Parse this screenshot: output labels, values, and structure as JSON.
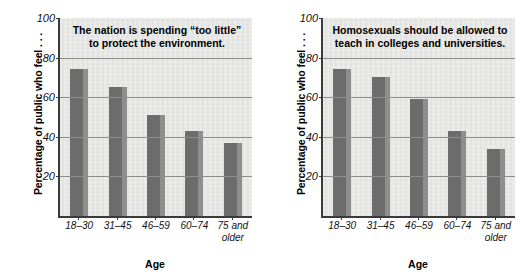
{
  "chart_data": [
    {
      "type": "bar",
      "title": "The nation is spending “too little” to protect the environment.",
      "title_line1": "The nation is spending “too little”",
      "title_line2": "to protect the environment.",
      "xlabel": "Age",
      "ylabel": "Percentage of public who feel . . .",
      "categories": [
        "18–30",
        "31–45",
        "46–59",
        "75 and older"
      ],
      "category_labels": [
        {
          "line1": "18–30",
          "line2": ""
        },
        {
          "line1": "31–45",
          "line2": ""
        },
        {
          "line1": "46–59",
          "line2": ""
        },
        {
          "line1": "60–74",
          "line2": ""
        },
        {
          "line1": "75 and",
          "line2": "older"
        }
      ],
      "values": [
        74,
        65,
        51,
        43,
        37
      ],
      "ylim": [
        0,
        100
      ],
      "yticks": [
        20,
        40,
        60,
        80,
        100
      ],
      "grid": true,
      "legend": "none",
      "bar_color": "#6c6c6c",
      "bar_side_color": "#8e8e8e",
      "plot_background": "#e9e9e7"
    },
    {
      "type": "bar",
      "title": "Homosexuals should be allowed to teach in colleges and universities.",
      "title_line1": "Homosexuals should be allowed to",
      "title_line2": "teach in colleges and universities.",
      "xlabel": "Age",
      "ylabel": "Percentage of public who feel . . .",
      "categories": [
        "18–30",
        "31–45",
        "46–59",
        "60–74",
        "75 and older"
      ],
      "category_labels": [
        {
          "line1": "18–30",
          "line2": ""
        },
        {
          "line1": "31–45",
          "line2": ""
        },
        {
          "line1": "46–59",
          "line2": ""
        },
        {
          "line1": "60–74",
          "line2": ""
        },
        {
          "line1": "75 and",
          "line2": "older"
        }
      ],
      "values": [
        74,
        70,
        59,
        43,
        34
      ],
      "ylim": [
        0,
        100
      ],
      "yticks": [
        20,
        40,
        60,
        80,
        100
      ],
      "grid": true,
      "legend": "none",
      "bar_color": "#6c6c6c",
      "bar_side_color": "#8e8e8e",
      "plot_background": "#e9e9e7"
    }
  ]
}
